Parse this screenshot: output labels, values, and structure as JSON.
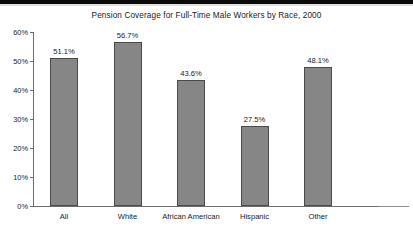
{
  "chart_data": {
    "type": "bar",
    "title": "Pension Coverage for Full-Time Male Workers by Race, 2000",
    "xlabel": "",
    "ylabel": "",
    "categories": [
      "All",
      "White",
      "African American",
      "Hispanic",
      "Other"
    ],
    "values": [
      51.1,
      56.7,
      43.6,
      27.5,
      48.1
    ],
    "value_labels": [
      "51.1%",
      "56.7%",
      "43.6%",
      "27.5%",
      "48.1%"
    ],
    "ylim": [
      0,
      60
    ],
    "yticks": [
      0,
      10,
      20,
      30,
      40,
      50,
      60
    ],
    "ytick_labels": [
      "0%",
      "10%",
      "20%",
      "30%",
      "40%",
      "50%",
      "60%"
    ],
    "grid": false,
    "legend": false,
    "series": [
      {
        "name": "Pension coverage rate",
        "values": [
          51.1,
          56.7,
          43.6,
          27.5,
          48.1
        ]
      }
    ],
    "colors": {
      "bar_fill": "#868686",
      "bar_outline": "#4a4a4a",
      "axis": "#6e6e6e",
      "text": "#1a1a1a",
      "background": "#ffffff"
    }
  }
}
